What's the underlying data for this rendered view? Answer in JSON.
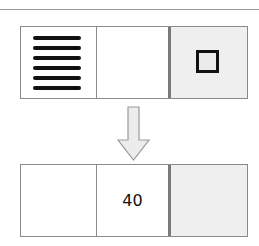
{
  "diagram": {
    "before": {
      "cells": [
        {
          "content": "horizontal-lines",
          "icon": "lines-icon"
        },
        {
          "content": ""
        },
        {
          "content": "square",
          "icon": "square-icon"
        }
      ]
    },
    "transition": {
      "icon": "down-arrow-icon"
    },
    "after": {
      "cells": [
        {
          "content": ""
        },
        {
          "content": "40"
        },
        {
          "content": ""
        }
      ]
    },
    "colors": {
      "border": "#8a8a8a",
      "shaded_cell": "#efefef",
      "ink": "#111111"
    }
  }
}
